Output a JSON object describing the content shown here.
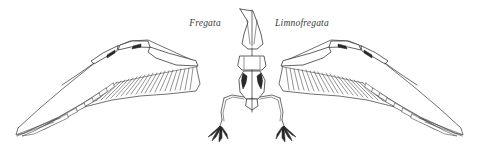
{
  "figure": {
    "caption_present": false,
    "background_color": "#ffffff",
    "line_color": "#2e2e2e",
    "label_color": "#3b3b3b",
    "width": 479,
    "height": 150
  },
  "labels": [
    {
      "id": "left-taxon",
      "text": "Fregata",
      "x": 205,
      "y": 26,
      "style": "italic",
      "anchor": "middle",
      "refers_to": "left wing"
    },
    {
      "id": "right-taxon",
      "text": "Limnofregata",
      "x": 302,
      "y": 26,
      "style": "italic",
      "anchor": "middle",
      "refers_to": "right wing"
    }
  ],
  "anatomy": {
    "skull": "elongate narrow beak tapering to point, dorsal view",
    "shoulder_girdle": "coracoids and furcula",
    "sternum": "shield shaped with central keel",
    "pelvis": "narrow posterior element",
    "legs": 2,
    "toes_per_foot": 4,
    "wings": 2,
    "wing_bones": [
      "humerus",
      "ulna",
      "carpometacarpus"
    ],
    "feather_groups": [
      "primaries",
      "secondaries"
    ]
  }
}
